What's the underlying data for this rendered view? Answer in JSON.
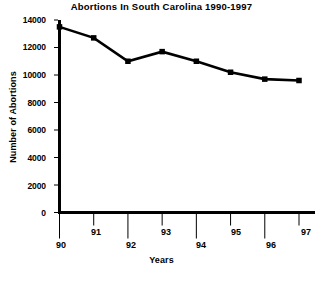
{
  "chart_data": {
    "type": "line",
    "title": "Abortions In South Carolina 1990-1997",
    "xlabel": "Years",
    "ylabel": "Number of Abortions",
    "categories": [
      "90",
      "91",
      "92",
      "93",
      "94",
      "95",
      "96",
      "97"
    ],
    "values": [
      13500,
      12700,
      11000,
      11700,
      11000,
      10200,
      9700,
      9600
    ],
    "series": [
      {
        "name": "Abortions",
        "values": [
          13500,
          12700,
          11000,
          11700,
          11000,
          10200,
          9700,
          9600
        ]
      }
    ],
    "ylim": [
      0,
      14000
    ],
    "ytick_labels": [
      "0",
      "2000",
      "4000",
      "6000",
      "8000",
      "10000",
      "12000",
      "14000"
    ],
    "ytick_values": [
      0,
      2000,
      4000,
      6000,
      8000,
      10000,
      12000,
      14000
    ],
    "xtick_labels": [
      "90",
      "91",
      "92",
      "93",
      "94",
      "95",
      "96",
      "97"
    ],
    "grid": false,
    "legend": false,
    "legend_position": "none",
    "marker": "square",
    "line_color": "#000000",
    "marker_color": "#000000",
    "background_color": "#ffffff",
    "axis_color": "#000000"
  }
}
